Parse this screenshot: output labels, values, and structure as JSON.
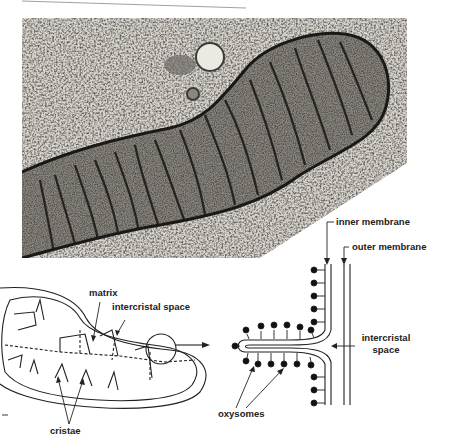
{
  "figure": {
    "micrograph": {
      "description": "Electron micrograph of a mitochondrion showing cristae"
    },
    "cutaway_diagram": {
      "labels": {
        "matrix": "matrix",
        "intercristal_space": "intercristal space",
        "cristae": "cristae"
      }
    },
    "membrane_detail": {
      "labels": {
        "inner_membrane": "inner membrane",
        "outer_membrane": "outer membrane",
        "intercristal_space_line1": "intercristal",
        "intercristal_space_line2": "space",
        "oxysomes": "oxysomes"
      }
    },
    "colors": {
      "ink": "#222222",
      "paper": "#ffffff",
      "photo_light": "#cfcbc4",
      "photo_dark": "#2a2a28"
    }
  }
}
